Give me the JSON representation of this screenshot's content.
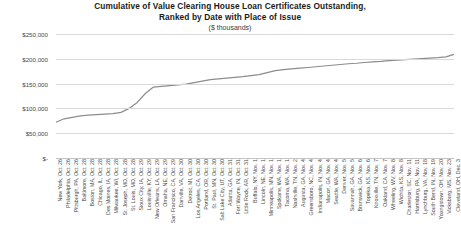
{
  "chart_data": {
    "type": "line",
    "title": "Cumulative of Value Clearing House Loan Certificates Outstanding,",
    "title_line2": "Ranked by Date with Place of Issue",
    "subtitle": "($ thousands)",
    "xlabel": "",
    "ylabel": "",
    "ylim": [
      0,
      250000
    ],
    "yticks": [
      0,
      50000,
      100000,
      150000,
      200000,
      250000
    ],
    "ytick_labels": [
      "$-",
      "$50,000",
      "$100,000",
      "$150,000",
      "$200,000",
      "$250,000"
    ],
    "grid": true,
    "legend": "none",
    "line_color": "#8c8c8c",
    "grid_color": "#d9d9d9",
    "categories": [
      "New York, Oct. 26",
      "Philadelphia, Oct. 26",
      "Pittsburgh, PA, Oct. 26",
      "Baltimore, Oct. 28",
      "Boston, MA, Oct. 28",
      "Chicago, IL, Oct. 28",
      "Des Moines, IA, Oct. 28",
      "Milwaukee, WI, Oct. 28",
      "St. Joseph, MO, Oct. 28",
      "St. Louis, MO, Oct. 28",
      "Sioux City, IA, Oct. 29",
      "Louisville, KY, Oct. 29",
      "New Orleans, LA, Oct. 29",
      "Omaha, NE, Oct. 29",
      "San Francisco, CA, Oct. 29",
      "Danville, VA, Oct. 30",
      "Detroit, MI, Oct. 30",
      "Los Angeles, CA, Oct. 30",
      "Portland, OR, Oct. 30",
      "St. Paul, MN, Oct. 30",
      "Salt Lake City, UT, Oct. 30",
      "Atlanta, GA, Oct. 31",
      "Fort Wayne, IN, Oct. 31",
      "Little Rock, AR, Oct. 31",
      "Buffalo, NY, Nov. 1",
      "Lincoln, NE, Nov. 1",
      "Minneapolis, MN, Nov. 1",
      "Spokane, WA, Nov. 1",
      "Tacoma, WA, Nov. 1",
      "Nashville, TN, Nov. 2",
      "Augusta, GA, Nov. 4",
      "Greensboro, NC, Nov. 4",
      "Indianapolis, IN, Nov. 4",
      "Macon, GA, Nov. 4",
      "Seattle, WA, Nov. 4",
      "Denver, Nov. 5",
      "Savannah, GA, Nov. 5",
      "Brunswick, GA, Nov. 6",
      "Topeka, KS, Nov. 6",
      "Knoxville, TN, Nov. 7",
      "Oakland, CA, Nov. 7",
      "Wheeling, WV, Nov. 8",
      "Wichita, KS, Nov. 8",
      "Charleston, SC, Nov. 11",
      "Harrisburg, PA, Nov. 11",
      "Lynchburg, VA, Nov. 18",
      "South Bend, IN, Nov. 19",
      "Youngstown, OH, Nov. 20",
      "Vicksburg, MS, Nov. 23",
      "Cleveland, OH, Dec. 3"
    ],
    "values": [
      72000,
      79000,
      82000,
      85000,
      86500,
      87500,
      88500,
      89500,
      92000,
      100000,
      112000,
      130000,
      143000,
      144500,
      146000,
      147500,
      149000,
      152000,
      155000,
      158000,
      159500,
      161000,
      162500,
      164000,
      166000,
      168000,
      172000,
      176000,
      178000,
      179500,
      181000,
      182500,
      184000,
      185500,
      187000,
      188500,
      190000,
      191000,
      192500,
      194000,
      195000,
      196500,
      197500,
      198500,
      199500,
      200500,
      201500,
      202500,
      204000,
      209000
    ]
  }
}
